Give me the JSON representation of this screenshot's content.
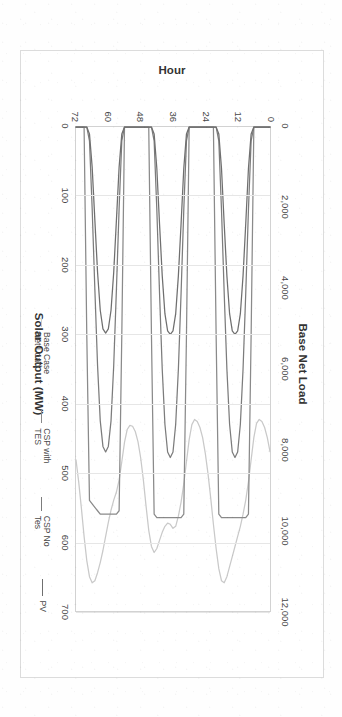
{
  "chart_data": {
    "type": "line",
    "title": "",
    "orientation": "rotated-90",
    "top_axis": {
      "label": "Base Net Load",
      "ticks": [
        "0",
        "2,000",
        "4,000",
        "6,000",
        "8,000",
        "10,000",
        "12,000"
      ],
      "values": [
        0,
        2000,
        4000,
        6000,
        8000,
        10000,
        12000
      ],
      "lim": [
        0,
        12000
      ]
    },
    "bottom_axis": {
      "label": "Solar Output (MW)",
      "ticks": [
        "0",
        "100",
        "200",
        "300",
        "400",
        "500",
        "600",
        "700"
      ],
      "values": [
        0,
        100,
        200,
        300,
        400,
        500,
        600,
        700
      ],
      "lim": [
        0,
        700
      ]
    },
    "category_axis": {
      "label": "Hour",
      "ticks": [
        "0",
        "12",
        "24",
        "36",
        "48",
        "60",
        "72"
      ],
      "values": [
        0,
        12,
        24,
        36,
        48,
        60,
        72
      ],
      "lim": [
        0,
        72
      ]
    },
    "xlabel": "Hour",
    "ylabel": "Solar Output (MW)",
    "ylabel2": "Base Net Load",
    "grid": true,
    "legend_position": "bottom",
    "x": [
      0,
      1,
      2,
      3,
      4,
      5,
      6,
      7,
      8,
      9,
      10,
      11,
      12,
      13,
      14,
      15,
      16,
      17,
      18,
      19,
      20,
      21,
      22,
      23,
      24,
      25,
      26,
      27,
      28,
      29,
      30,
      31,
      32,
      33,
      34,
      35,
      36,
      37,
      38,
      39,
      40,
      41,
      42,
      43,
      44,
      45,
      46,
      47,
      48,
      49,
      50,
      51,
      52,
      53,
      54,
      55,
      56,
      57,
      58,
      59,
      60,
      61,
      62,
      63,
      64,
      65,
      66,
      67,
      68,
      69,
      70,
      71,
      72
    ],
    "series": [
      {
        "name": "Base Case Net Load",
        "axis": "top",
        "color": "#c9c9c9",
        "units": "MW",
        "values": [
          8050,
          7700,
          7450,
          7300,
          7250,
          7350,
          7700,
          8250,
          8800,
          9250,
          9600,
          9900,
          10150,
          10400,
          10650,
          10900,
          11150,
          11300,
          11250,
          10950,
          10450,
          9850,
          9200,
          8600,
          8100,
          7700,
          7450,
          7300,
          7250,
          7380,
          7750,
          8300,
          8850,
          9300,
          9650,
          9900,
          9950,
          9850,
          9820,
          9900,
          10050,
          10250,
          10450,
          10550,
          10400,
          10000,
          9400,
          8750,
          8200,
          7800,
          7550,
          7420,
          7400,
          7500,
          7820,
          8300,
          8750,
          9050,
          9250,
          9500,
          9800,
          10150,
          10500,
          10800,
          11050,
          11250,
          11300,
          11150,
          10750,
          10150,
          9450,
          8800,
          8250
        ]
      },
      {
        "name": "CSP with TES",
        "axis": "bottom",
        "color": "#8a8a8a",
        "units": "MW",
        "values": [
          0,
          0,
          0,
          0,
          0,
          0,
          0,
          300,
          560,
          565,
          565,
          565,
          565,
          565,
          565,
          565,
          565,
          565,
          565,
          560,
          300,
          0,
          0,
          0,
          0,
          0,
          0,
          0,
          0,
          0,
          0,
          300,
          560,
          565,
          565,
          565,
          565,
          565,
          565,
          565,
          565,
          565,
          565,
          560,
          300,
          0,
          0,
          0,
          0,
          0,
          0,
          0,
          0,
          0,
          0,
          300,
          555,
          560,
          560,
          560,
          560,
          560,
          560,
          560,
          555,
          550,
          545,
          540,
          300,
          0,
          0,
          0,
          0
        ]
      },
      {
        "name": "CSP No Tes",
        "axis": "bottom",
        "color": "#7c7c7c",
        "units": "MW",
        "values": [
          0,
          0,
          0,
          0,
          0,
          0,
          0,
          20,
          120,
          240,
          350,
          430,
          470,
          478,
          470,
          430,
          350,
          240,
          120,
          20,
          0,
          0,
          0,
          0,
          0,
          0,
          0,
          0,
          0,
          0,
          0,
          20,
          120,
          240,
          350,
          430,
          470,
          478,
          470,
          430,
          350,
          240,
          120,
          20,
          0,
          0,
          0,
          0,
          0,
          0,
          0,
          0,
          0,
          0,
          0,
          20,
          118,
          235,
          345,
          425,
          462,
          470,
          462,
          425,
          345,
          235,
          118,
          20,
          0,
          0,
          0,
          0,
          0
        ]
      },
      {
        "name": "PV",
        "axis": "bottom",
        "color": "#6f6f6f",
        "units": "MW",
        "values": [
          0,
          0,
          0,
          0,
          0,
          0,
          0,
          10,
          60,
          140,
          215,
          270,
          295,
          300,
          295,
          270,
          215,
          140,
          60,
          10,
          0,
          0,
          0,
          0,
          0,
          0,
          0,
          0,
          0,
          0,
          0,
          10,
          60,
          140,
          215,
          270,
          295,
          300,
          295,
          270,
          215,
          140,
          60,
          10,
          0,
          0,
          0,
          0,
          0,
          0,
          0,
          0,
          0,
          0,
          0,
          10,
          58,
          135,
          210,
          265,
          292,
          298,
          292,
          265,
          210,
          135,
          58,
          10,
          0,
          0,
          0,
          0,
          0
        ]
      }
    ],
    "legend": [
      {
        "label": "Base Case Net Load",
        "color": "#c9c9c9"
      },
      {
        "label": "CSP with TES",
        "color": "#8a8a8a"
      },
      {
        "label": "CSP No Tes",
        "color": "#7c7c7c"
      },
      {
        "label": "PV",
        "color": "#6f6f6f"
      }
    ]
  }
}
